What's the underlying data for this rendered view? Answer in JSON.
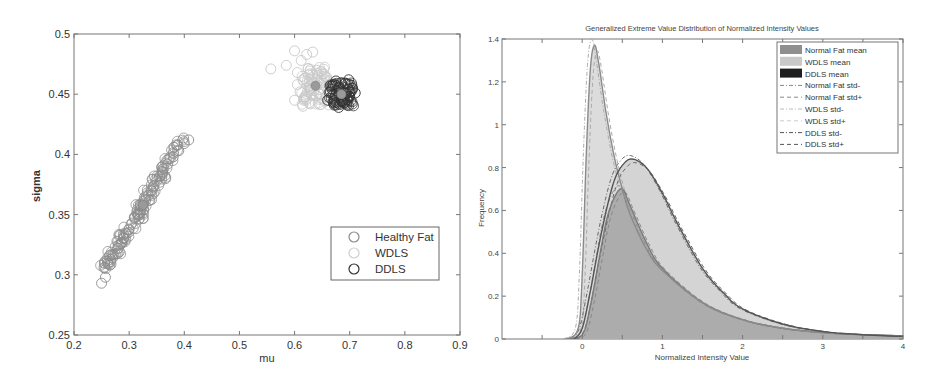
{
  "chart_data": [
    {
      "type": "scatter",
      "title": "",
      "xlabel": "mu",
      "ylabel": "sigma",
      "xlim": [
        0.2,
        0.9
      ],
      "ylim": [
        0.25,
        0.5
      ],
      "xticks": [
        "0.2",
        "0.3",
        "0.4",
        "0.5",
        "0.6",
        "0.7",
        "0.8",
        "0.9"
      ],
      "yticks": [
        "0.25",
        "0.3",
        "0.35",
        "0.4",
        "0.45",
        "0.5"
      ],
      "grid": false,
      "legend_position": "lower right",
      "marker": "open-circle",
      "series": [
        {
          "name": "Healthy Fat",
          "color": "#8c8c8c",
          "mean": {
            "x": 0.325,
            "y": 0.358
          },
          "cluster": {
            "x_range": [
              0.245,
              0.41
            ],
            "y_range": [
              0.292,
              0.413
            ],
            "shape": "elongated diagonal"
          },
          "points": [
            [
              0.25,
              0.293
            ],
            [
              0.257,
              0.298
            ],
            [
              0.265,
              0.308
            ],
            [
              0.27,
              0.314
            ],
            [
              0.275,
              0.317
            ],
            [
              0.28,
              0.322
            ],
            [
              0.285,
              0.326
            ],
            [
              0.29,
              0.33
            ],
            [
              0.295,
              0.334
            ],
            [
              0.3,
              0.338
            ],
            [
              0.305,
              0.343
            ],
            [
              0.31,
              0.347
            ],
            [
              0.315,
              0.35
            ],
            [
              0.32,
              0.354
            ],
            [
              0.325,
              0.358
            ],
            [
              0.33,
              0.362
            ],
            [
              0.335,
              0.366
            ],
            [
              0.34,
              0.37
            ],
            [
              0.345,
              0.374
            ],
            [
              0.35,
              0.378
            ],
            [
              0.355,
              0.382
            ],
            [
              0.36,
              0.386
            ],
            [
              0.37,
              0.392
            ],
            [
              0.38,
              0.398
            ],
            [
              0.39,
              0.403
            ],
            [
              0.4,
              0.409
            ],
            [
              0.408,
              0.412
            ]
          ]
        },
        {
          "name": "WDLS",
          "color": "#c8c8c8",
          "mean": {
            "x": 0.638,
            "y": 0.457
          },
          "cluster": {
            "x_range": [
              0.555,
              0.665
            ],
            "y_range": [
              0.436,
              0.487
            ],
            "shape": "diffuse"
          },
          "points": [
            [
              0.557,
              0.471
            ],
            [
              0.585,
              0.474
            ],
            [
              0.6,
              0.486
            ],
            [
              0.612,
              0.478
            ],
            [
              0.622,
              0.483
            ],
            [
              0.633,
              0.485
            ],
            [
              0.605,
              0.468
            ],
            [
              0.615,
              0.462
            ],
            [
              0.625,
              0.466
            ],
            [
              0.64,
              0.47
            ],
            [
              0.65,
              0.467
            ],
            [
              0.61,
              0.452
            ],
            [
              0.62,
              0.448
            ],
            [
              0.63,
              0.455
            ],
            [
              0.6,
              0.445
            ],
            [
              0.615,
              0.44
            ],
            [
              0.628,
              0.442
            ],
            [
              0.645,
              0.45
            ],
            [
              0.605,
              0.458
            ],
            [
              0.635,
              0.46
            ]
          ]
        },
        {
          "name": "DDLS",
          "color": "#333333",
          "mean": {
            "x": 0.685,
            "y": 0.45
          },
          "cluster": {
            "x_range": [
              0.655,
              0.715
            ],
            "y_range": [
              0.438,
              0.463
            ],
            "shape": "compact"
          },
          "points": [
            [
              0.66,
              0.445
            ],
            [
              0.665,
              0.452
            ],
            [
              0.67,
              0.458
            ],
            [
              0.675,
              0.461
            ],
            [
              0.68,
              0.455
            ],
            [
              0.685,
              0.45
            ],
            [
              0.69,
              0.446
            ],
            [
              0.695,
              0.441
            ],
            [
              0.7,
              0.448
            ],
            [
              0.705,
              0.455
            ],
            [
              0.71,
              0.451
            ],
            [
              0.672,
              0.441
            ],
            [
              0.68,
              0.439
            ],
            [
              0.692,
              0.459
            ],
            [
              0.698,
              0.462
            ],
            [
              0.688,
              0.444
            ]
          ]
        }
      ]
    },
    {
      "type": "area",
      "title": "Generalized Extreme Value Distribution of Normalized Intensity Values",
      "xlabel": "Normalized Intensity Value",
      "ylabel": "Frequency",
      "xlim": [
        -1,
        4
      ],
      "ylim": [
        0,
        1.4
      ],
      "xticks": [
        "0",
        "1",
        "2",
        "3",
        "4"
      ],
      "yticks": [
        "0",
        "0.2",
        "0.4",
        "0.6",
        "0.8",
        "1",
        "1.2",
        "1.4"
      ],
      "grid": false,
      "legend_position": "upper right",
      "legend": [
        "Normal Fat mean",
        "WDLS mean",
        "DDLS mean",
        "Normal Fat std-",
        "Normal Fat std+",
        "WDLS std-",
        "WDLS std+",
        "DDLS std-",
        "DDLS std+"
      ],
      "series": [
        {
          "name": "Normal Fat mean",
          "fill": "#a9a9a9",
          "peak": {
            "x": 0.5,
            "y": 0.7
          },
          "x": [
            -0.2,
            0.0,
            0.1,
            0.2,
            0.3,
            0.4,
            0.5,
            0.6,
            0.8,
            1.0,
            1.5,
            2.0,
            2.5,
            3.0,
            3.5,
            4.0
          ],
          "values": [
            0.0,
            0.02,
            0.15,
            0.35,
            0.55,
            0.66,
            0.7,
            0.62,
            0.45,
            0.33,
            0.17,
            0.09,
            0.05,
            0.03,
            0.02,
            0.015
          ]
        },
        {
          "name": "WDLS mean",
          "fill": "#d6d6d6",
          "peak": {
            "x": 0.15,
            "y": 1.37
          },
          "x": [
            -0.2,
            -0.05,
            0.0,
            0.05,
            0.1,
            0.15,
            0.2,
            0.3,
            0.4,
            0.5,
            0.6,
            0.8,
            1.0,
            1.5,
            2.0,
            2.5,
            3.0,
            3.5,
            4.0
          ],
          "values": [
            0.0,
            0.05,
            0.3,
            0.85,
            1.25,
            1.37,
            1.3,
            1.05,
            0.85,
            0.7,
            0.58,
            0.42,
            0.32,
            0.17,
            0.09,
            0.05,
            0.03,
            0.02,
            0.015
          ]
        },
        {
          "name": "DDLS mean",
          "fill": "#cfcfcf",
          "line": "#555555",
          "peak": {
            "x": 0.62,
            "y": 0.84
          },
          "x": [
            -0.1,
            0.0,
            0.1,
            0.2,
            0.3,
            0.4,
            0.5,
            0.62,
            0.8,
            1.0,
            1.2,
            1.5,
            1.75,
            2.0,
            2.5,
            3.0,
            3.5,
            4.0
          ],
          "values": [
            0.0,
            0.05,
            0.22,
            0.42,
            0.6,
            0.74,
            0.81,
            0.84,
            0.8,
            0.68,
            0.53,
            0.33,
            0.22,
            0.14,
            0.07,
            0.035,
            0.02,
            0.012
          ]
        }
      ],
      "std_lines": [
        {
          "name": "Normal Fat std-",
          "style": "dash-dot"
        },
        {
          "name": "Normal Fat std+",
          "style": "dashed"
        },
        {
          "name": "WDLS std-",
          "style": "dash-dot"
        },
        {
          "name": "WDLS std+",
          "style": "dashed"
        },
        {
          "name": "DDLS std-",
          "style": "dash-dot"
        },
        {
          "name": "DDLS std+",
          "style": "dashed"
        }
      ]
    }
  ]
}
